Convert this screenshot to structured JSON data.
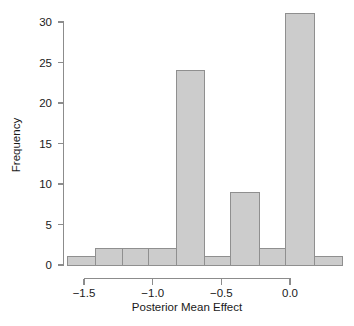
{
  "chart_data": {
    "type": "bar",
    "title": "",
    "subtitle": "",
    "xlabel": "Posterior Mean Effect",
    "ylabel": "Frequency",
    "xlim": [
      -1.62,
      0.38
    ],
    "ylim": [
      0,
      31
    ],
    "grid": false,
    "legend": "none",
    "bin_width": 0.1,
    "bin_edges": [
      -1.6,
      -1.5,
      -1.4,
      -1.3,
      -1.2,
      -1.1,
      -1.0,
      -0.9,
      -0.8,
      -0.7,
      -0.6
    ],
    "bin_labels": [
      "-1.60 to -1.50",
      "-1.50 to -1.40",
      "-1.40 to -1.30",
      "-1.30 to -1.20",
      "-1.20 to -1.10",
      "-1.10 to -1.00",
      "-1.00 to -0.90",
      "-0.90 to -0.80",
      "-0.80 to -0.70",
      "-0.70 to -0.60"
    ],
    "categories": [
      "-1.55",
      "-1.45",
      "-1.35",
      "-1.25",
      "-1.15",
      "-1.05",
      "-0.95",
      "-0.85",
      "-0.75",
      "-0.65"
    ],
    "values": [
      1,
      2,
      2,
      2,
      24,
      1,
      9,
      2,
      31,
      1
    ],
    "bars": [
      {
        "x0": -1.62,
        "x1": -1.42,
        "value": 1
      },
      {
        "x0": -1.42,
        "x1": -1.22,
        "value": 2
      },
      {
        "x0": -1.22,
        "x1": -1.03,
        "value": 2
      },
      {
        "x0": -1.03,
        "x1": -0.83,
        "value": 2
      },
      {
        "x0": -0.83,
        "x1": -0.62,
        "value": 24
      },
      {
        "x0": -0.62,
        "x1": -0.43,
        "value": 1
      },
      {
        "x0": -0.43,
        "x1": -0.22,
        "value": 9
      },
      {
        "x0": -0.22,
        "x1": -0.03,
        "value": 2
      },
      {
        "x0": -0.03,
        "x1": 0.18,
        "value": 31
      },
      {
        "x0": 0.18,
        "x1": 0.38,
        "value": 1
      }
    ],
    "xticks": [
      -1.5,
      -1.0,
      -0.5,
      0.0
    ],
    "xtick_labels": [
      "−1.5",
      "−1.0",
      "−0.5",
      "0.0"
    ],
    "yticks": [
      0,
      5,
      10,
      15,
      20,
      25,
      30
    ],
    "ytick_labels": [
      "0",
      "5",
      "10",
      "15",
      "20",
      "25",
      "30"
    ],
    "total_count": 75,
    "colors": {
      "bar_fill": "#cccccc",
      "bar_stroke": "#8f8f8f",
      "axis": "#8c8c8c",
      "text": "#1a1a1a",
      "background": "#ffffff"
    }
  }
}
